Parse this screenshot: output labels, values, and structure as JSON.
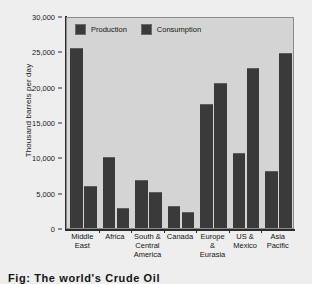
{
  "chart_data": {
    "type": "bar",
    "title": "",
    "xlabel": "",
    "ylabel": "Thousand barrels per day",
    "ylim": [
      0,
      30000
    ],
    "yticks": [
      0,
      5000,
      10000,
      15000,
      20000,
      25000,
      30000
    ],
    "ytick_labels": [
      "0",
      "5,000",
      "10,000",
      "15,000",
      "20,000",
      "25,000",
      "30,000"
    ],
    "grid": false,
    "legend_position": "top-left-inside",
    "categories": [
      "Middle East",
      "Africa",
      "South & Central America",
      "Canada",
      "Europe & Eurasia",
      "US & Mexico",
      "Asia Pacific"
    ],
    "category_lines": [
      [
        "Middle",
        "East"
      ],
      [
        "Africa"
      ],
      [
        "South &",
        "Central",
        "America"
      ],
      [
        "Canada"
      ],
      [
        "Europe",
        "&",
        "Eurasia"
      ],
      [
        "US &",
        "Mexico"
      ],
      [
        "Asia",
        "Pacific"
      ]
    ],
    "series": [
      {
        "name": "Production",
        "color": "#3a3a3a",
        "values": [
          25500,
          10000,
          6800,
          3100,
          17500,
          10600,
          8000
        ]
      },
      {
        "name": "Consumption",
        "color": "#3a3a3a",
        "values": [
          6000,
          2800,
          5100,
          2200,
          20500,
          22600,
          24700
        ]
      }
    ]
  },
  "legend": {
    "items": [
      {
        "label": "Production",
        "color": "#3a3a3a"
      },
      {
        "label": "Consumption",
        "color": "#3a3a3a"
      }
    ]
  },
  "caption": {
    "text": "Fig: The world's Crude Oil"
  },
  "colors": {
    "page_background": "#eeeeee",
    "plot_background": "#d4d4d4",
    "bar": "#3a3a3a",
    "axis": "#2b2b2b",
    "text": "#141414"
  }
}
